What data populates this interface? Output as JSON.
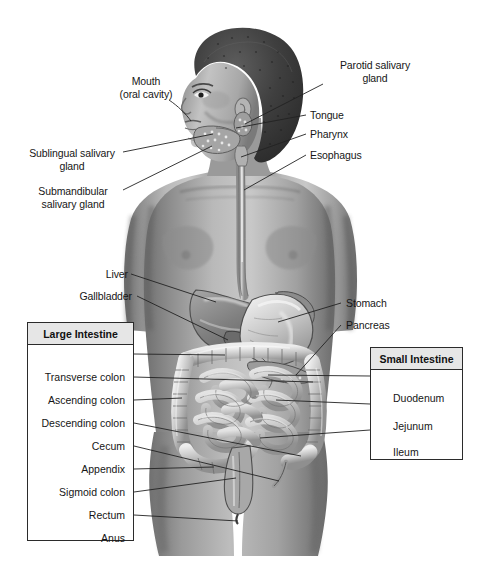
{
  "figure": {
    "background_color": "#ffffff",
    "line_color": "#232323",
    "box_border_color": "#2b2b2b",
    "box_header_fill": "#e6e6e6"
  },
  "callouts": {
    "mouth": {
      "line1": "Mouth",
      "line2": "(oral cavity)"
    },
    "sublingual": {
      "line1": "Sublingual salivary",
      "line2": "gland"
    },
    "submandibular": {
      "line1": "Submandibular",
      "line2": "salivary gland"
    },
    "parotid": {
      "line1": "Parotid salivary",
      "line2": "gland"
    },
    "tongue": {
      "label": "Tongue"
    },
    "pharynx": {
      "label": "Pharynx"
    },
    "esophagus": {
      "label": "Esophagus"
    },
    "liver": {
      "label": "Liver"
    },
    "gallbladder": {
      "label": "Gallbladder"
    },
    "stomach": {
      "label": "Stomach"
    },
    "pancreas": {
      "label": "Pancreas"
    }
  },
  "large_intestine_box": {
    "title": "Large Intestine",
    "items": [
      {
        "label": "Transverse colon"
      },
      {
        "label": "Ascending colon"
      },
      {
        "label": "Descending colon"
      },
      {
        "label": "Cecum"
      },
      {
        "label": "Appendix"
      },
      {
        "label": "Sigmoid colon"
      },
      {
        "label": "Rectum"
      },
      {
        "label": "Anus"
      }
    ]
  },
  "small_intestine_box": {
    "title": "Small Intestine",
    "items": [
      {
        "label": "Duodenum"
      },
      {
        "label": "Jejunum"
      },
      {
        "label": "Ileum"
      }
    ]
  },
  "organs_depicted": [
    "hair",
    "head",
    "face",
    "ear",
    "neck",
    "shoulders",
    "arms",
    "torso",
    "salivary glands",
    "esophagus",
    "liver",
    "gallbladder",
    "stomach",
    "pancreas",
    "small intestine",
    "large intestine",
    "appendix",
    "sigmoid colon",
    "rectum",
    "hips",
    "legs"
  ]
}
